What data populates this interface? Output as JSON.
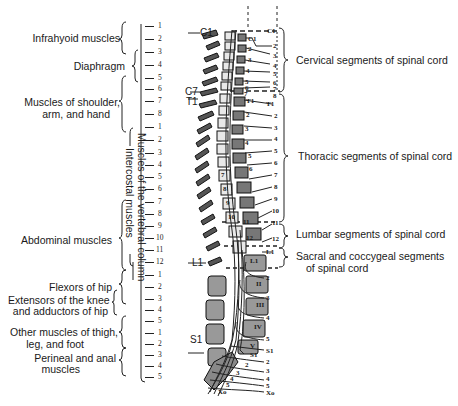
{
  "left_labels": {
    "infrahyoid": "Infrahyoid muscles",
    "diaphragm": "Diaphragm",
    "shoulder_1": "Muscles of shoulder,",
    "shoulder_2": "arm, and hand",
    "abdominal": "Abdominal muscles",
    "flexors_hip": "Flexors of hip",
    "extensors_1": "Extensors of the knee",
    "extensors_2": "and adductors of hip",
    "other_1": "Other muscles of thigh,",
    "other_2": "leg, and foot",
    "perineal_1": "Perineal and anal",
    "perineal_2": "muscles",
    "vertebral_column": "Muscles of the vertebral column",
    "intercostal": "Intercostal muscles"
  },
  "segment_scale": {
    "cervical": [
      "1",
      "2",
      "3",
      "4",
      "5",
      "6",
      "7",
      "8"
    ],
    "thoracic": [
      "1",
      "2",
      "3",
      "4",
      "5",
      "6",
      "7",
      "8",
      "9",
      "10",
      "11",
      "12"
    ],
    "lumbar": [
      "1",
      "2",
      "3",
      "4",
      "5"
    ],
    "sacral": [
      "1",
      "2",
      "3",
      "4",
      "5"
    ]
  },
  "vertebra_labels": {
    "c1": "C1",
    "c7": "C7",
    "t1": "T1",
    "l1": "L1",
    "s1": "S1"
  },
  "right_labels": {
    "cervical": "Cervical segments of spinal cord",
    "thoracic": "Thoracic segments of spinal cord",
    "lumbar": "Lumbar segments of spinal cord",
    "sacral_1": "Sacral and coccygeal segments",
    "sacral_2": "of spinal cord"
  },
  "nerve_root_labels": {
    "cervical": [
      "C1",
      "2",
      "3",
      "4",
      "5",
      "6",
      "7",
      "8"
    ],
    "thoracic": [
      "T1",
      "2",
      "3",
      "4",
      "5",
      "6",
      "7",
      "8",
      "9",
      "10",
      "11",
      "12"
    ],
    "lumbar": [
      "L1",
      "2",
      "3",
      "4",
      "5"
    ],
    "sacral": [
      "S1",
      "2",
      "3",
      "4",
      "5",
      "Xo"
    ]
  },
  "vertebral_body_labels": {
    "cervical": [
      "C1",
      "2",
      "3",
      "4",
      "5",
      "6",
      "7"
    ],
    "thoracic": [
      "T1",
      "2",
      "3",
      "4",
      "5",
      "6",
      "7",
      "8",
      "9",
      "10",
      "11",
      "12"
    ],
    "lumbar": [
      "L1",
      "II",
      "III",
      "IV",
      "V"
    ],
    "sacral": [
      "S1",
      "2",
      "3",
      "4",
      "5",
      "Xo"
    ]
  }
}
